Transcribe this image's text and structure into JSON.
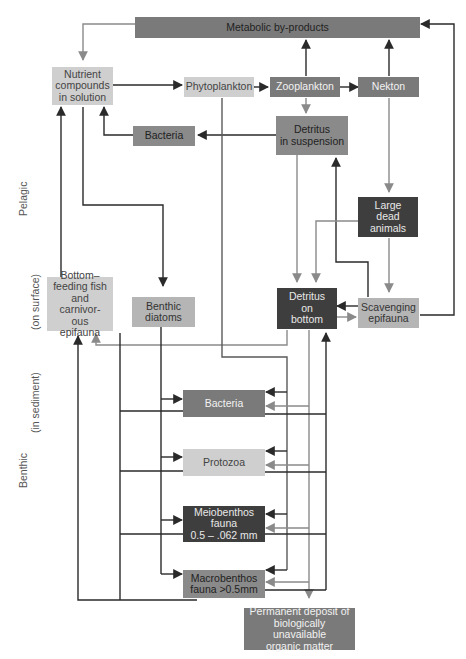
{
  "diagram": {
    "type": "marine food web / nutrient cycle flow diagram",
    "side_labels": {
      "pelagic": "Pelagic",
      "on_surface": "(on surface)",
      "in_sediment": "(in sediment)",
      "benthic": "Benthic"
    },
    "nodes": {
      "metabolic": "Metabolic by-products",
      "nutrient": "Nutrient\ncompounds\nin solution",
      "phytoplankton": "Phytoplankton",
      "zooplankton": "Zooplankton",
      "nekton": "Nekton",
      "bacteria_pelagic": "Bacteria",
      "detritus_suspension": "Detritus\nin suspension",
      "large_dead": "Large\ndead\nanimals",
      "bottom_feeding": "Bottom–\nfeeding fish\nand carnivor-\nous epifauna",
      "benthic_diatoms": "Benthic\ndiatoms",
      "detritus_bottom": "Detritus\non\nbottom",
      "scavenging": "Scavenging\nepifauna",
      "bacteria_benthic": "Bacteria",
      "protozoa": "Protozoa",
      "meiobenthos": "Meiobenthos\nfauna\n0.5 – .062 mm",
      "macrobenthos": "Macrobenthos\nfauna >0.5mm",
      "permanent_deposit": "Permanent deposit of\nbiologically unavailable\norganic matter"
    },
    "edges": [
      {
        "from": "Metabolic by-products",
        "to": "Nutrient compounds in solution"
      },
      {
        "from": "Nutrient compounds in solution",
        "to": "Phytoplankton"
      },
      {
        "from": "Nutrient compounds in solution",
        "to": "Benthic diatoms"
      },
      {
        "from": "Phytoplankton",
        "to": "Zooplankton"
      },
      {
        "from": "Phytoplankton",
        "to": "Benthic fauna (sediment)"
      },
      {
        "from": "Zooplankton",
        "to": "Nekton"
      },
      {
        "from": "Zooplankton",
        "to": "Metabolic by-products"
      },
      {
        "from": "Zooplankton",
        "to": "Detritus in suspension"
      },
      {
        "from": "Nekton",
        "to": "Metabolic by-products"
      },
      {
        "from": "Nekton",
        "to": "Large dead animals"
      },
      {
        "from": "Detritus in suspension",
        "to": "Bacteria"
      },
      {
        "from": "Bacteria",
        "to": "Nutrient compounds in solution"
      },
      {
        "from": "Detritus in suspension",
        "to": "Detritus on bottom"
      },
      {
        "from": "Large dead animals",
        "to": "Detritus on bottom"
      },
      {
        "from": "Large dead animals",
        "to": "Scavenging epifauna"
      },
      {
        "from": "Scavenging epifauna",
        "to": "Detritus on bottom"
      },
      {
        "from": "Detritus on bottom",
        "to": "Scavenging epifauna"
      },
      {
        "from": "Scavenging epifauna",
        "to": "Detritus in suspension"
      },
      {
        "from": "Scavenging epifauna",
        "to": "Metabolic by-products"
      },
      {
        "from": "Bottom-feeding fish",
        "to": "Nutrient compounds in solution"
      },
      {
        "from": "Detritus on bottom",
        "to": "Bottom-feeding fish"
      },
      {
        "from": "Benthic diatoms",
        "to": "Bacteria / Protozoa / Meiobenthos / Macrobenthos"
      },
      {
        "from": "Detritus on bottom",
        "to": "Bacteria / Protozoa / Meiobenthos / Macrobenthos"
      },
      {
        "from": "Benthic fauna",
        "to": "Detritus on bottom"
      },
      {
        "from": "Benthic fauna",
        "to": "Bottom-feeding fish"
      },
      {
        "from": "Detritus on bottom",
        "to": "Permanent deposit"
      }
    ]
  }
}
